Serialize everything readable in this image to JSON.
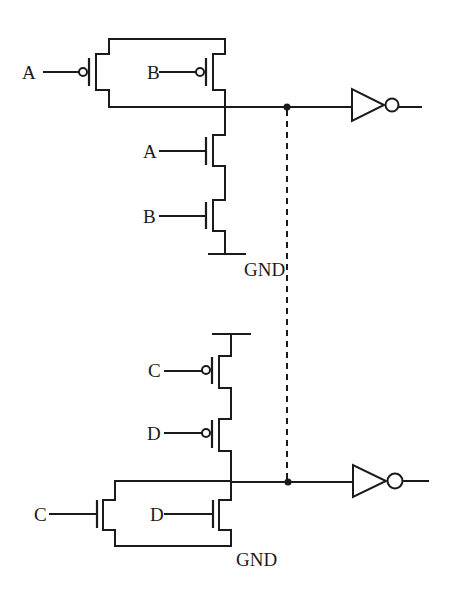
{
  "diagram": {
    "type": "cmos-circuit",
    "stroke_color": "#1a1a1a",
    "background": "#ffffff",
    "top_circuit": {
      "name": "NAND-style network (A, B)",
      "pull_up": [
        {
          "type": "pmos",
          "gate": "A",
          "arrangement": "parallel"
        },
        {
          "type": "pmos",
          "gate": "B",
          "arrangement": "parallel"
        }
      ],
      "pull_down": [
        {
          "type": "nmos",
          "gate": "A",
          "arrangement": "series"
        },
        {
          "type": "nmos",
          "gate": "B",
          "arrangement": "series"
        }
      ],
      "ground_label": "GND",
      "output": "inverter"
    },
    "bottom_circuit": {
      "name": "NOR-style network (C, D)",
      "pull_up": [
        {
          "type": "pmos",
          "gate": "C",
          "arrangement": "series"
        },
        {
          "type": "pmos",
          "gate": "D",
          "arrangement": "series"
        }
      ],
      "pull_down": [
        {
          "type": "nmos",
          "gate": "C",
          "arrangement": "parallel"
        },
        {
          "type": "nmos",
          "gate": "D",
          "arrangement": "parallel"
        }
      ],
      "ground_label": "GND",
      "output": "inverter"
    },
    "connection": "dashed wire linking the two output nodes",
    "labels": {
      "top_pmos_a": "A",
      "top_pmos_b": "B",
      "top_nmos_a": "A",
      "top_nmos_b": "B",
      "top_gnd": "GND",
      "bot_pmos_c": "C",
      "bot_pmos_d": "D",
      "bot_nmos_c": "C",
      "bot_nmos_d": "D",
      "bot_gnd": "GND"
    }
  }
}
